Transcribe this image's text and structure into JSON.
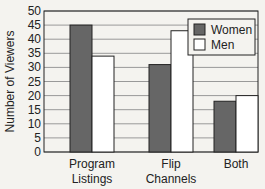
{
  "chart_data": {
    "type": "bar",
    "title": "",
    "xlabel": "",
    "ylabel": "Number of Viewers",
    "categories": [
      "Program Listings",
      "Flip Channels",
      "Both"
    ],
    "category_lines": [
      [
        "Program",
        "Listings"
      ],
      [
        "Flip",
        "Channels"
      ],
      [
        "Both"
      ]
    ],
    "series": [
      {
        "name": "Women",
        "values": [
          45,
          31,
          18
        ],
        "color": "#666666"
      },
      {
        "name": "Men",
        "values": [
          34,
          43,
          20
        ],
        "color": "#ffffff"
      }
    ],
    "ylim": [
      0,
      50
    ],
    "yticks": [
      0,
      5,
      10,
      15,
      20,
      25,
      30,
      35,
      40,
      45,
      50
    ],
    "grid": true,
    "legend_position": "top-right"
  }
}
